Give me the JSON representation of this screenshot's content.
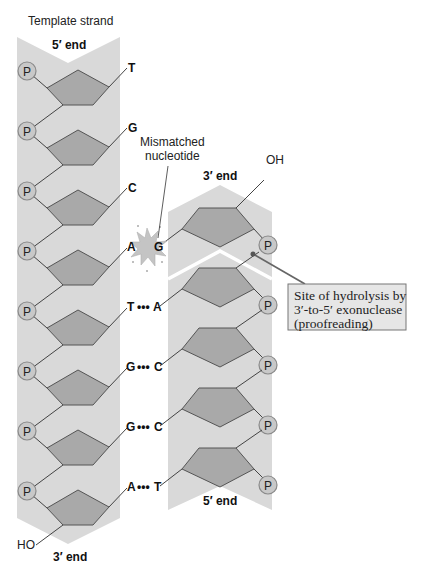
{
  "diagram": {
    "title": "Template strand",
    "template_strand": {
      "top_end_label": "5′ end",
      "bottom_end_label": "3′ end",
      "bottom_terminal": "HO",
      "phosphate_label": "P",
      "bases": [
        "T",
        "G",
        "C",
        "A",
        "T",
        "G",
        "G",
        "A"
      ]
    },
    "new_strand": {
      "top_end_label": "3′ end",
      "bottom_end_label": "5′ end",
      "top_terminal": "OH",
      "phosphate_label": "P",
      "bases": [
        "G",
        "A",
        "C",
        "C",
        "T"
      ]
    },
    "base_pairs": [
      {
        "template": "T",
        "new": null
      },
      {
        "template": "G",
        "new": null
      },
      {
        "template": "C",
        "new": null
      },
      {
        "template": "A",
        "new": "G",
        "mismatch": true
      },
      {
        "template": "T",
        "new": "A",
        "bond": "•••"
      },
      {
        "template": "G",
        "new": "C",
        "bond": "•••"
      },
      {
        "template": "G",
        "new": "C",
        "bond": "•••"
      },
      {
        "template": "A",
        "new": "T",
        "bond": "•••"
      }
    ],
    "mismatch_label_line1": "Mismatched",
    "mismatch_label_line2": "nucleotide",
    "callout": {
      "line1": "Site of hydrolysis by",
      "line2": "3′-to-5′ exonuclease",
      "line3": "(proofreading)"
    },
    "colors": {
      "strand_background": "#d9d9d9",
      "sugar_fill": "#a9a9a9",
      "phosphate_fill": "#c8c8c8",
      "callout_fill": "#e6e6e6",
      "callout_line": "#666666"
    }
  }
}
